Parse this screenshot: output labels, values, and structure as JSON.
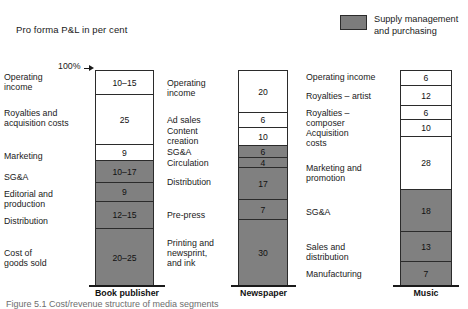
{
  "title": "Pro forma P&L in per cent",
  "legend": {
    "swatch_color": "#7c7c7c",
    "label_line1": "Supply management",
    "label_line2": "and purchasing"
  },
  "axis_marker": {
    "label": "100%"
  },
  "caption": "Figure 5.1  Cost/revenue structure of media segments",
  "chart_data": {
    "type": "bar",
    "title": "Pro forma P&L in per cent",
    "xlabel": "",
    "ylabel": "Per cent",
    "ylim": [
      0,
      100
    ],
    "grid": false,
    "legend_position": "top-right",
    "legend_entries": [
      "Supply management and purchasing"
    ],
    "stacked": true,
    "categories": [
      "Book publisher",
      "Newspaper",
      "Music"
    ],
    "series": [
      {
        "name": "Book publisher",
        "segments": [
          {
            "label": "Operating income",
            "value": "10–15",
            "low": 10,
            "high": 15,
            "shade": "white"
          },
          {
            "label": "Royalties and acquisition costs",
            "value": "25",
            "low": 25,
            "high": 25,
            "shade": "white"
          },
          {
            "label": "Marketing",
            "value": "9",
            "low": 9,
            "high": 9,
            "shade": "white"
          },
          {
            "label": "SG&A",
            "value": "10–17",
            "low": 10,
            "high": 17,
            "shade": "grey"
          },
          {
            "label": "Editorial and production",
            "value": "9",
            "low": 9,
            "high": 9,
            "shade": "grey"
          },
          {
            "label": "Distribution",
            "value": "12–15",
            "low": 12,
            "high": 15,
            "shade": "grey"
          },
          {
            "label": "Cost of goods sold",
            "value": "20–25",
            "low": 20,
            "high": 25,
            "shade": "grey"
          }
        ]
      },
      {
        "name": "Newspaper",
        "segments": [
          {
            "label": "Operating income",
            "value": "20",
            "low": 20,
            "high": 20,
            "shade": "white"
          },
          {
            "label": "Ad sales",
            "value": "6",
            "low": 6,
            "high": 6,
            "shade": "white"
          },
          {
            "label": "Content creation",
            "value": "10",
            "low": 10,
            "high": 10,
            "shade": "white"
          },
          {
            "label": "SG&A",
            "value": "6",
            "low": 6,
            "high": 6,
            "shade": "grey"
          },
          {
            "label": "Circulation",
            "value": "4",
            "low": 4,
            "high": 4,
            "shade": "grey"
          },
          {
            "label": "Distribution",
            "value": "17",
            "low": 17,
            "high": 17,
            "shade": "grey"
          },
          {
            "label": "Pre-press",
            "value": "7",
            "low": 7,
            "high": 7,
            "shade": "grey"
          },
          {
            "label": "Printing and newsprint, and ink",
            "value": "30",
            "low": 30,
            "high": 30,
            "shade": "grey"
          }
        ]
      },
      {
        "name": "Music",
        "segments": [
          {
            "label": "Operating income",
            "value": "6",
            "low": 6,
            "high": 6,
            "shade": "white"
          },
          {
            "label": "Royalties – artist",
            "value": "12",
            "low": 12,
            "high": 12,
            "shade": "white"
          },
          {
            "label": "Royalties – composer",
            "value": "6",
            "low": 6,
            "high": 6,
            "shade": "white"
          },
          {
            "label": "Acquisition costs",
            "value": "10",
            "low": 10,
            "high": 10,
            "shade": "white"
          },
          {
            "label": "Marketing and promotion",
            "value": "28",
            "low": 28,
            "high": 28,
            "shade": "white"
          },
          {
            "label": "SG&A",
            "value": "18",
            "low": 18,
            "high": 18,
            "shade": "grey"
          },
          {
            "label": "Sales and distribution",
            "value": "13",
            "low": 13,
            "high": 13,
            "shade": "grey"
          },
          {
            "label": "Manufacturing",
            "value": "7",
            "low": 7,
            "high": 7,
            "shade": "grey"
          }
        ]
      }
    ]
  },
  "columns": [
    {
      "name": "Book publisher",
      "bar": {
        "left": 95,
        "width": 59,
        "top": 0,
        "height": 215
      },
      "baseline": {
        "left": 89,
        "width": 76,
        "top": 215
      },
      "axis_label": {
        "left": 89,
        "width": 76,
        "top": 218
      },
      "segments": [
        {
          "value": "10–15",
          "shade": "white",
          "h": 24,
          "label": "Operating\nincome",
          "lx": 4,
          "lw": 84,
          "ly": 2,
          "align": "left"
        },
        {
          "value": "25",
          "shade": "white",
          "h": 50,
          "label": "Royalties and\nacquisition costs",
          "lx": 4,
          "lw": 84,
          "ly": 38,
          "align": "left"
        },
        {
          "value": "9",
          "shade": "white",
          "h": 16,
          "label": "Marketing",
          "lx": 4,
          "lw": 84,
          "ly": 81,
          "align": "left"
        },
        {
          "value": "10–17",
          "shade": "grey",
          "h": 22,
          "label": "SG&A",
          "lx": 4,
          "lw": 84,
          "ly": 102,
          "align": "left"
        },
        {
          "value": "9",
          "shade": "grey",
          "h": 19,
          "label": "Editorial and\nproduction",
          "lx": 4,
          "lw": 84,
          "ly": 119,
          "align": "left"
        },
        {
          "value": "12–15",
          "shade": "grey",
          "h": 27,
          "label": "Distribution",
          "lx": 4,
          "lw": 84,
          "ly": 146,
          "align": "left"
        },
        {
          "value": "20–25",
          "shade": "grey",
          "h": 57,
          "label": "Cost of\ngoods sold",
          "lx": 4,
          "lw": 84,
          "ly": 178,
          "align": "left"
        }
      ]
    },
    {
      "name": "Newspaper",
      "bar": {
        "left": 238,
        "width": 50,
        "top": 0,
        "height": 215
      },
      "baseline": {
        "left": 231,
        "width": 65,
        "top": 215
      },
      "axis_label": {
        "left": 231,
        "width": 65,
        "top": 218
      },
      "segments": [
        {
          "value": "20",
          "shade": "white",
          "h": 42,
          "label": "Operating\nincome",
          "lx": 167,
          "lw": 66,
          "ly": 8,
          "align": "left"
        },
        {
          "value": "6",
          "shade": "white",
          "h": 15,
          "label": "Ad sales",
          "lx": 167,
          "lw": 66,
          "ly": 45,
          "align": "left"
        },
        {
          "value": "10",
          "shade": "white",
          "h": 18,
          "label": "Content\ncreation",
          "lx": 167,
          "lw": 66,
          "ly": 56,
          "align": "left"
        },
        {
          "value": "6",
          "shade": "grey",
          "h": 12,
          "label": "SG&A",
          "lx": 167,
          "lw": 66,
          "ly": 77,
          "align": "left"
        },
        {
          "value": "4",
          "shade": "grey",
          "h": 10,
          "label": "Circulation",
          "lx": 167,
          "lw": 66,
          "ly": 88,
          "align": "left"
        },
        {
          "value": "17",
          "shade": "grey",
          "h": 32,
          "label": "Distribution",
          "lx": 167,
          "lw": 66,
          "ly": 107,
          "align": "left"
        },
        {
          "value": "7",
          "shade": "grey",
          "h": 20,
          "label": "Pre-press",
          "lx": 167,
          "lw": 66,
          "ly": 140,
          "align": "left"
        },
        {
          "value": "30",
          "shade": "grey",
          "h": 66,
          "label": "Printing and\nnewsprint,\nand ink",
          "lx": 167,
          "lw": 66,
          "ly": 168,
          "align": "left"
        }
      ]
    },
    {
      "name": "Music",
      "bar": {
        "left": 400,
        "width": 52,
        "top": 0,
        "height": 215
      },
      "baseline": {
        "left": 393,
        "width": 66,
        "top": 215
      },
      "axis_label": {
        "left": 393,
        "width": 66,
        "top": 218
      },
      "segments": [
        {
          "value": "6",
          "shade": "white",
          "h": 15,
          "label": "Operating income",
          "lx": 306,
          "lw": 90,
          "ly": 2,
          "align": "left"
        },
        {
          "value": "12",
          "shade": "white",
          "h": 20,
          "label": "Royalties – artist",
          "lx": 306,
          "lw": 90,
          "ly": 21,
          "align": "left"
        },
        {
          "value": "6",
          "shade": "white",
          "h": 14,
          "label": "Royalties –\ncomposer",
          "lx": 306,
          "lw": 90,
          "ly": 38,
          "align": "left"
        },
        {
          "value": "10",
          "shade": "white",
          "h": 17,
          "label": "Acquisition\ncosts",
          "lx": 306,
          "lw": 90,
          "ly": 58,
          "align": "left"
        },
        {
          "value": "28",
          "shade": "white",
          "h": 53,
          "label": "Marketing and\npromotion",
          "lx": 306,
          "lw": 90,
          "ly": 93,
          "align": "left"
        },
        {
          "value": "18",
          "shade": "grey",
          "h": 42,
          "label": "SG&A",
          "lx": 306,
          "lw": 90,
          "ly": 137,
          "align": "left"
        },
        {
          "value": "13",
          "shade": "grey",
          "h": 30,
          "label": "Sales and\ndistribution",
          "lx": 306,
          "lw": 90,
          "ly": 172,
          "align": "left"
        },
        {
          "value": "7",
          "shade": "grey",
          "h": 24,
          "label": "Manufacturing",
          "lx": 306,
          "lw": 90,
          "ly": 199,
          "align": "left"
        }
      ]
    }
  ]
}
